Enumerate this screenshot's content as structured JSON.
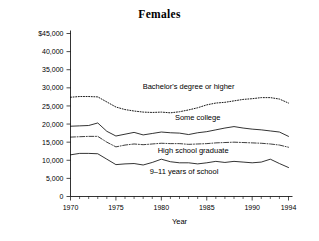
{
  "chart_data": {
    "type": "line",
    "title": "Females",
    "xlabel": "Year",
    "ylabel": "",
    "xlim": [
      1970,
      1994
    ],
    "ylim": [
      0,
      45000
    ],
    "grid": false,
    "legend_position": "inline-annotations",
    "x": [
      1970,
      1971,
      1972,
      1973,
      1974,
      1975,
      1976,
      1977,
      1978,
      1979,
      1980,
      1981,
      1982,
      1983,
      1984,
      1985,
      1986,
      1987,
      1988,
      1989,
      1990,
      1991,
      1992,
      1993,
      1994
    ],
    "xticks": [
      1970,
      1975,
      1980,
      1985,
      1990,
      1994
    ],
    "xtick_labels": [
      "1970",
      "1975",
      "1980",
      "1985",
      "1990",
      "1994"
    ],
    "yticks": [
      0,
      5000,
      10000,
      15000,
      20000,
      25000,
      30000,
      35000,
      40000,
      45000
    ],
    "ytick_labels": [
      "0",
      "5,000",
      "10,000",
      "15,000",
      "20,000",
      "25,000",
      "30,000",
      "35,000",
      "40,000",
      "$45,000"
    ],
    "series": [
      {
        "name": "Bachelor's degree or higher",
        "style": "dotted",
        "label_x": 1983.0,
        "label_y": 29600,
        "values": [
          27400,
          27600,
          27600,
          27500,
          26100,
          24700,
          24000,
          23600,
          23300,
          23200,
          23300,
          23100,
          23400,
          23900,
          24500,
          25300,
          25800,
          26000,
          26400,
          26800,
          27000,
          27300,
          27300,
          26900,
          25800
        ]
      },
      {
        "name": "Some college",
        "style": "solid",
        "label_x": 1984.0,
        "label_y": 21000,
        "values": [
          19400,
          19500,
          19600,
          20300,
          18000,
          16700,
          17200,
          17700,
          17000,
          17400,
          17800,
          17600,
          17500,
          17100,
          17600,
          17900,
          18400,
          18900,
          19300,
          18900,
          18600,
          18400,
          18100,
          17800,
          16600
        ]
      },
      {
        "name": "High school graduate",
        "style": "dashdot",
        "label_x": 1983.5,
        "label_y": 11900,
        "values": [
          16400,
          16500,
          16600,
          16600,
          15000,
          13700,
          14200,
          14500,
          14300,
          14500,
          14700,
          14600,
          14600,
          14400,
          14500,
          14600,
          14800,
          14900,
          15000,
          14900,
          14800,
          14700,
          14500,
          14200,
          13600
        ]
      },
      {
        "name": "9–11 years of school",
        "style": "solid",
        "label_x": 1982.5,
        "label_y": 6300,
        "values": [
          11500,
          11900,
          11900,
          11800,
          10300,
          8800,
          9000,
          9100,
          8700,
          9400,
          10300,
          9600,
          9300,
          9300,
          9000,
          9300,
          9700,
          9400,
          9700,
          9500,
          9300,
          9500,
          10300,
          9100,
          8000
        ]
      }
    ]
  }
}
